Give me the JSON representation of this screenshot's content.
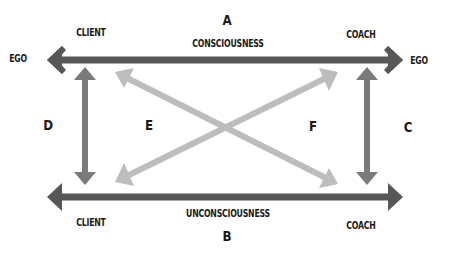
{
  "diagram": {
    "colors": {
      "horizontal_arrows": "#575757",
      "vertical_arrows": "#7a7a7a",
      "diagonal_arrows": "#bdbdbd",
      "text": "#1a1a1a",
      "background": "#ffffff"
    },
    "top": {
      "letter": "A",
      "label": "CONSCIOUSNESS",
      "left_end": "EGO",
      "right_end": "EGO",
      "left_role": "CLIENT",
      "right_role": "COACH"
    },
    "bottom": {
      "letter": "B",
      "label": "UNCONSCIOUSNESS",
      "left_role": "CLIENT",
      "right_role": "COACH"
    },
    "sides": {
      "left_letter": "D",
      "right_letter": "C"
    },
    "diagonals": {
      "left_letter": "E",
      "right_letter": "F"
    },
    "arrows": [
      {
        "id": "A",
        "type": "horizontal-double",
        "from": [
          47,
          60
        ],
        "to": [
          403,
          60
        ]
      },
      {
        "id": "B",
        "type": "horizontal-double",
        "from": [
          47,
          197
        ],
        "to": [
          403,
          197
        ]
      },
      {
        "id": "D",
        "type": "vertical-double",
        "from": [
          85,
          68
        ],
        "to": [
          85,
          184
        ]
      },
      {
        "id": "C",
        "type": "vertical-double",
        "from": [
          367,
          68
        ],
        "to": [
          367,
          184
        ]
      },
      {
        "id": "diag-1",
        "type": "diagonal-double",
        "from": [
          115,
          72
        ],
        "to": [
          338,
          184
        ]
      },
      {
        "id": "diag-2",
        "type": "diagonal-double",
        "from": [
          115,
          182
        ],
        "to": [
          338,
          72
        ]
      }
    ]
  }
}
